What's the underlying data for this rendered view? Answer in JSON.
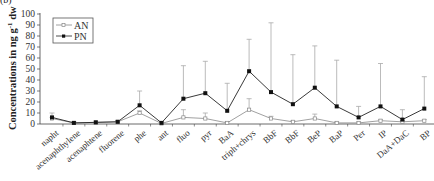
{
  "panel_label": "(b)",
  "chart_data": {
    "type": "line",
    "title": "",
    "xlabel": "",
    "ylabel": "Concentrations in ng g-1 dw",
    "ylabel_parts": {
      "main": "Concentrations in ng g",
      "sup": "-1",
      "suffix": " dw"
    },
    "ylim": [
      0,
      100
    ],
    "yticks": [
      0,
      10,
      20,
      30,
      40,
      50,
      60,
      70,
      80,
      90,
      100
    ],
    "grid": false,
    "legend_position": "upper-left",
    "categories": [
      "napht",
      "acenaphthylene",
      "acenaphtene",
      "fluorene",
      "phe",
      "ant",
      "fluo",
      "pyr",
      "BaA",
      "triph+chrys",
      "BbF",
      "BbF",
      "BeP",
      "BaP",
      "Per",
      "IP",
      "DaA+DaC",
      "BP"
    ],
    "series": [
      {
        "name": "AN",
        "marker": "open-square",
        "color": "#888888",
        "values": [
          5,
          1,
          1.5,
          2,
          10,
          0.5,
          6,
          5,
          1,
          13,
          5,
          2,
          5,
          1,
          1,
          3,
          2,
          3
        ],
        "error_upper": [
          6,
          1.5,
          2,
          2.5,
          12,
          1,
          13,
          10,
          2,
          23,
          7,
          3,
          9,
          2,
          2,
          4,
          3,
          4
        ]
      },
      {
        "name": "PN",
        "marker": "filled-square",
        "color": "#222222",
        "values": [
          6,
          1,
          1.5,
          2,
          17,
          1,
          23,
          28,
          12,
          48,
          29,
          18,
          33,
          16,
          6,
          16,
          4,
          14
        ],
        "error_upper": [
          10,
          2,
          2,
          3,
          30,
          2,
          53,
          57,
          37,
          77,
          92,
          63,
          71,
          58,
          16,
          55,
          13,
          43
        ]
      }
    ]
  }
}
